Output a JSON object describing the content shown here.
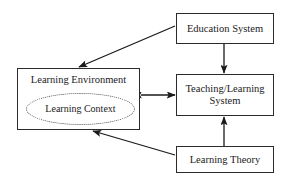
{
  "diagram": {
    "background_color": "#ffffff",
    "stroke_color": "#2b2b2b",
    "text_color": "#1a1a1a",
    "nodes": [
      {
        "id": "education-system",
        "label": "Education System",
        "shape": "rectangle",
        "x": 176,
        "y": 13,
        "width": 98,
        "height": 31
      },
      {
        "id": "learning-environment",
        "label": "Learning Environment",
        "shape": "rectangle",
        "x": 17,
        "y": 68,
        "width": 123,
        "height": 62
      },
      {
        "id": "learning-context",
        "label": "Learning Context",
        "shape": "ellipse-dotted",
        "x": 25,
        "y": 92,
        "width": 107,
        "height": 30
      },
      {
        "id": "teaching-learning-system",
        "label": "Teaching/Learning\nSystem",
        "shape": "rectangle",
        "x": 176,
        "y": 74,
        "width": 98,
        "height": 42
      },
      {
        "id": "learning-theory",
        "label": "Learning Theory",
        "shape": "rectangle",
        "x": 176,
        "y": 146,
        "width": 98,
        "height": 27
      }
    ],
    "edges": [
      {
        "id": "education-to-learning-environment",
        "from": "education-system",
        "to": "learning-environment",
        "direction": "one-way",
        "style": "solid-diagonal"
      },
      {
        "id": "education-to-teaching-learning-system",
        "from": "education-system",
        "to": "teaching-learning-system",
        "direction": "one-way",
        "style": "solid-vertical"
      },
      {
        "id": "learning-environment-to-teaching-learning-system",
        "from": "learning-environment",
        "to": "teaching-learning-system",
        "direction": "bidirectional",
        "style": "solid-horizontal"
      },
      {
        "id": "learning-theory-to-teaching-learning-system",
        "from": "learning-theory",
        "to": "teaching-learning-system",
        "direction": "one-way",
        "style": "solid-vertical"
      },
      {
        "id": "learning-theory-to-learning-environment",
        "from": "learning-theory",
        "to": "learning-environment",
        "direction": "one-way",
        "style": "solid-diagonal"
      }
    ]
  }
}
